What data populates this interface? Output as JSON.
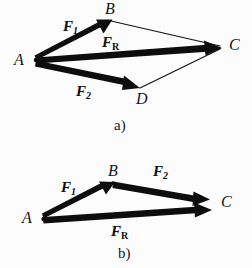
{
  "figure": {
    "background_color": "#fcfcfc",
    "ink_color": "#101010",
    "panels": [
      {
        "id": "a",
        "caption": "a)",
        "caption_pos": {
          "x": 114,
          "y": 118
        },
        "description": "parallelogram rule for adding two force vectors",
        "vertices": [
          {
            "name": "A",
            "label": "A",
            "point": {
              "x": 36,
              "y": 60
            },
            "label_pos": {
              "x": 14,
              "y": 52
            }
          },
          {
            "name": "B",
            "label": "B",
            "point": {
              "x": 110,
              "y": 21
            },
            "label_pos": {
              "x": 105,
              "y": 1
            }
          },
          {
            "name": "C",
            "label": "C",
            "point": {
              "x": 221,
              "y": 47
            },
            "label_pos": {
              "x": 229,
              "y": 37
            }
          },
          {
            "name": "D",
            "label": "D",
            "point": {
              "x": 139,
              "y": 88
            },
            "label_pos": {
              "x": 136,
              "y": 91
            }
          }
        ],
        "thick_arrows": [
          {
            "name": "F1",
            "from": "A",
            "to": "B"
          },
          {
            "name": "FR",
            "from": "A",
            "to": "C"
          },
          {
            "name": "F2",
            "from": "A",
            "to": "D"
          }
        ],
        "thin_lines": [
          {
            "from": "B",
            "to": "C"
          },
          {
            "from": "D",
            "to": "C"
          }
        ],
        "force_labels": [
          {
            "name": "F1",
            "base": "F",
            "sub": "1",
            "sub_style": "italic",
            "pos": {
              "x": 63,
              "y": 19
            }
          },
          {
            "name": "FR",
            "base": "F",
            "sub": "R",
            "sub_style": "roman",
            "pos": {
              "x": 102,
              "y": 35
            }
          },
          {
            "name": "F2",
            "base": "F",
            "sub": "2",
            "sub_style": "italic",
            "pos": {
              "x": 76,
              "y": 84
            }
          }
        ]
      },
      {
        "id": "b",
        "caption": "b)",
        "caption_pos": {
          "x": 118,
          "y": 246
        },
        "description": "triangle rule head-to-tail addition of the same two forces",
        "vertices": [
          {
            "name": "A",
            "label": "A",
            "point": {
              "x": 43,
              "y": 218
            },
            "label_pos": {
              "x": 22,
              "y": 210
            }
          },
          {
            "name": "B",
            "label": "B",
            "point": {
              "x": 113,
              "y": 183
            },
            "label_pos": {
              "x": 108,
              "y": 163
            }
          },
          {
            "name": "C",
            "label": "C",
            "point": {
              "x": 211,
              "y": 204
            },
            "label_pos": {
              "x": 221,
              "y": 194
            }
          }
        ],
        "thick_arrows": [
          {
            "name": "F1",
            "from": "A",
            "to": "B"
          },
          {
            "name": "F2",
            "from": "B",
            "to": "C"
          },
          {
            "name": "FR",
            "from": "A",
            "to": "C"
          }
        ],
        "thin_lines": [],
        "force_labels": [
          {
            "name": "F1",
            "base": "F",
            "sub": "1",
            "sub_style": "italic",
            "pos": {
              "x": 61,
              "y": 180
            }
          },
          {
            "name": "F2",
            "base": "F",
            "sub": "2",
            "sub_style": "italic",
            "pos": {
              "x": 153,
              "y": 164
            }
          },
          {
            "name": "FR",
            "base": "F",
            "sub": "R",
            "sub_style": "roman",
            "pos": {
              "x": 111,
              "y": 224
            }
          }
        ]
      }
    ]
  }
}
